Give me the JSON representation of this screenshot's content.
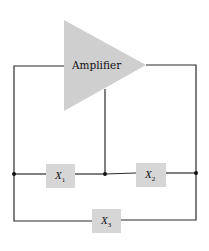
{
  "diagram": {
    "amplifier": {
      "label": "Amplifier"
    },
    "components": [
      {
        "id": "x1",
        "label": "X",
        "subscript": "1"
      },
      {
        "id": "x2",
        "label": "X",
        "subscript": "2"
      },
      {
        "id": "x3",
        "label": "X",
        "subscript": "3"
      }
    ],
    "colors": {
      "amplifier_fill": "#cfcfcf",
      "component_fill": "#d6d6d6",
      "wire": "#2a2a2a",
      "node": "#111111"
    }
  }
}
